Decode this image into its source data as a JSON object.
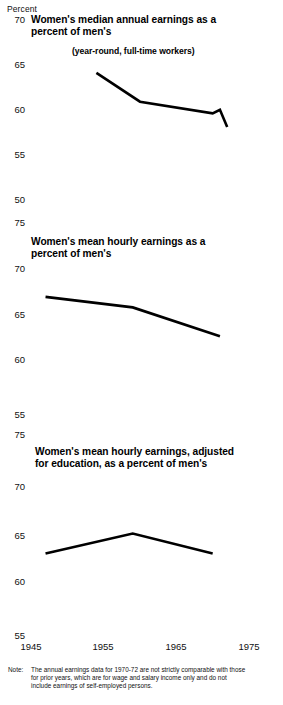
{
  "axis_unit_label": "Percent",
  "xticks": [
    "1945",
    "1955",
    "1965",
    "1975"
  ],
  "panels": [
    {
      "title": "Women's median annual earnings as a\npercent of men's",
      "title_line1": "Women's median annual earnings as a",
      "title_line2": "percent of men's",
      "subtitle": "(year-round, full-time workers)",
      "yticks": [
        "70",
        "65",
        "60",
        "55",
        "50"
      ]
    },
    {
      "title_line1": "Women's mean hourly earnings as a",
      "title_line2": "percent of men's",
      "subtitle": "",
      "yticks": [
        "75",
        "70",
        "65",
        "60",
        "55"
      ]
    },
    {
      "title_line1": "Women's mean hourly earnings, adjusted",
      "title_line2": "for education, as a percent of men's",
      "subtitle": "",
      "yticks": [
        "75",
        "70",
        "65",
        "60",
        "55"
      ]
    }
  ],
  "note": {
    "label": "Note:",
    "text": "The annual earnings data for 1970-72 are not strictly comparable with those for prior years, which are for wage and salary income only and do not include earnings of self-employed persons."
  },
  "chart_data": [
    {
      "type": "line",
      "title": "Women's median annual earnings as a percent of men's",
      "subtitle": "(year-round, full-time workers)",
      "xlabel": "",
      "ylabel": "Percent",
      "xlim": [
        1945,
        1975
      ],
      "ylim": [
        50,
        70
      ],
      "yticks": [
        50,
        55,
        60,
        65,
        70
      ],
      "xticks": [
        1945,
        1955,
        1965,
        1975
      ],
      "grid": false,
      "legend": "none",
      "series": [
        {
          "name": "Women's median annual earnings as a percent of men's",
          "x": [
            1954,
            1960,
            1970,
            1971,
            1972
          ],
          "values": [
            63.9,
            60.7,
            59.4,
            59.8,
            57.9
          ]
        }
      ]
    },
    {
      "type": "line",
      "title": "Women's mean hourly earnings as a percent of men's",
      "xlabel": "",
      "ylabel": "Percent",
      "xlim": [
        1945,
        1975
      ],
      "ylim": [
        55,
        75
      ],
      "yticks": [
        55,
        60,
        65,
        70,
        75
      ],
      "xticks": [
        1945,
        1955,
        1965,
        1975
      ],
      "grid": false,
      "legend": "none",
      "series": [
        {
          "name": "Women's mean hourly earnings as a percent of men's",
          "x": [
            1947,
            1959,
            1971
          ],
          "values": [
            67.1,
            66.0,
            63.0
          ]
        }
      ]
    },
    {
      "type": "line",
      "title": "Women's mean hourly earnings, adjusted for education, as a percent of men's",
      "xlabel": "",
      "ylabel": "Percent",
      "xlim": [
        1945,
        1975
      ],
      "ylim": [
        55,
        75
      ],
      "yticks": [
        55,
        60,
        65,
        70,
        75
      ],
      "xticks": [
        1945,
        1955,
        1965,
        1975
      ],
      "grid": false,
      "legend": "none",
      "series": [
        {
          "name": "Women's mean hourly earnings, adjusted for education, as a percent of men's",
          "x": [
            1947,
            1959,
            1970
          ],
          "values": [
            63.0,
            65.0,
            63.0
          ]
        }
      ]
    }
  ]
}
